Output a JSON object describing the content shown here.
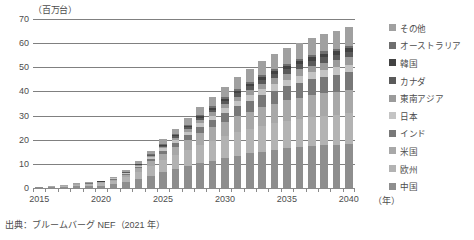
{
  "chart_data": {
    "type": "bar",
    "stacked": true,
    "title": "",
    "subtitle": "",
    "xlabel": "(年)",
    "ylabel": "(百万台)",
    "unit_label": "（百万台）",
    "x_unit_label": "（年）",
    "ylim": [
      0,
      70
    ],
    "ytick_step": 10,
    "yticks": [
      0,
      10,
      20,
      30,
      40,
      50,
      60,
      70
    ],
    "grid": true,
    "legend_position": "right",
    "categories": [
      "2015",
      "2016",
      "2017",
      "2018",
      "2019",
      "2020",
      "2021",
      "2022",
      "2023",
      "2024",
      "2025",
      "2026",
      "2027",
      "2028",
      "2029",
      "2030",
      "2031",
      "2032",
      "2033",
      "2034",
      "2035",
      "2036",
      "2037",
      "2038",
      "2039",
      "2040"
    ],
    "tick_labels": [
      "2015",
      "2020",
      "2025",
      "2030",
      "2035",
      "2040"
    ],
    "tick_label_positions": [
      0,
      5,
      10,
      15,
      20,
      25
    ],
    "series": [
      {
        "name": "中国",
        "color": "#8e8e8e",
        "values": [
          0.3,
          0.4,
          0.6,
          0.8,
          0.9,
          1.0,
          1.5,
          2.4,
          3.6,
          5.0,
          6.5,
          7.8,
          9.0,
          10.2,
          11.3,
          12.4,
          13.4,
          14.3,
          15.1,
          15.8,
          16.4,
          16.9,
          17.3,
          17.7,
          18.0,
          18.3
        ]
      },
      {
        "name": "欧州",
        "color": "#b3b3b3",
        "values": [
          0.1,
          0.2,
          0.3,
          0.4,
          0.6,
          0.9,
          1.4,
          2.1,
          3.0,
          4.0,
          5.0,
          5.9,
          6.8,
          7.6,
          8.3,
          9.0,
          9.6,
          10.1,
          10.6,
          11.0,
          11.4,
          11.7,
          12.0,
          12.2,
          12.4,
          12.6
        ]
      },
      {
        "name": "米国",
        "color": "#a8a8a8",
        "values": [
          0.1,
          0.1,
          0.2,
          0.3,
          0.3,
          0.4,
          0.6,
          1.0,
          1.5,
          2.1,
          2.8,
          3.5,
          4.2,
          4.9,
          5.5,
          6.1,
          6.7,
          7.2,
          7.7,
          8.1,
          8.5,
          8.8,
          9.1,
          9.3,
          9.5,
          9.7
        ]
      },
      {
        "name": "インド",
        "color": "#787878",
        "values": [
          0.0,
          0.0,
          0.0,
          0.1,
          0.1,
          0.1,
          0.2,
          0.3,
          0.5,
          0.8,
          1.1,
          1.5,
          2.0,
          2.5,
          3.0,
          3.6,
          4.1,
          4.6,
          5.1,
          5.5,
          5.9,
          6.3,
          6.6,
          6.9,
          7.1,
          7.3
        ]
      },
      {
        "name": "日本",
        "color": "#c4c4c4",
        "values": [
          0.05,
          0.05,
          0.1,
          0.1,
          0.1,
          0.2,
          0.3,
          0.4,
          0.6,
          0.8,
          1.0,
          1.2,
          1.4,
          1.6,
          1.8,
          2.0,
          2.2,
          2.3,
          2.5,
          2.6,
          2.7,
          2.8,
          2.9,
          3.0,
          3.0,
          3.1
        ]
      },
      {
        "name": "東南アジア",
        "color": "#9b9b9b",
        "values": [
          0.0,
          0.0,
          0.0,
          0.0,
          0.05,
          0.05,
          0.1,
          0.2,
          0.3,
          0.4,
          0.6,
          0.8,
          1.0,
          1.2,
          1.4,
          1.6,
          1.8,
          2.0,
          2.2,
          2.4,
          2.5,
          2.7,
          2.8,
          2.9,
          3.0,
          3.1
        ]
      },
      {
        "name": "カナダ",
        "color": "#5a5a5a",
        "values": [
          0.0,
          0.0,
          0.0,
          0.05,
          0.05,
          0.05,
          0.1,
          0.15,
          0.25,
          0.4,
          0.55,
          0.7,
          0.85,
          1.0,
          1.15,
          1.3,
          1.45,
          1.6,
          1.7,
          1.8,
          1.9,
          2.0,
          2.05,
          2.1,
          2.15,
          2.2
        ]
      },
      {
        "name": "韓国",
        "color": "#424242",
        "values": [
          0.0,
          0.0,
          0.0,
          0.0,
          0.05,
          0.05,
          0.1,
          0.15,
          0.2,
          0.3,
          0.4,
          0.5,
          0.6,
          0.7,
          0.8,
          0.9,
          1.0,
          1.1,
          1.2,
          1.3,
          1.35,
          1.4,
          1.45,
          1.5,
          1.55,
          1.6
        ]
      },
      {
        "name": "オーストラリア",
        "color": "#6e6e6e",
        "values": [
          0.0,
          0.0,
          0.0,
          0.0,
          0.0,
          0.05,
          0.05,
          0.1,
          0.15,
          0.2,
          0.3,
          0.35,
          0.45,
          0.5,
          0.6,
          0.65,
          0.7,
          0.75,
          0.8,
          0.85,
          0.9,
          0.95,
          1.0,
          1.0,
          1.05,
          1.1
        ]
      },
      {
        "name": "その他",
        "color": "#a0a0a0",
        "values": [
          0.05,
          0.05,
          0.1,
          0.15,
          0.2,
          0.3,
          0.45,
          0.7,
          1.0,
          1.4,
          1.9,
          2.4,
          2.9,
          3.4,
          3.9,
          4.4,
          4.9,
          5.3,
          5.7,
          6.1,
          6.4,
          6.7,
          7.0,
          7.3,
          7.5,
          7.7
        ]
      }
    ],
    "totals": [
      0.6,
      0.8,
      1.3,
      1.9,
      2.3,
      3.1,
      4.8,
      7.5,
      11.1,
      15.4,
      20.2,
      24.6,
      29.2,
      33.6,
      37.8,
      41.9,
      45.8,
      49.2,
      52.6,
      55.5,
      57.9,
      60.2,
      62.1,
      63.9,
      65.2,
      66.7
    ]
  },
  "source": {
    "text": "出典：ブルームバーグ NEF（2021 年）"
  }
}
